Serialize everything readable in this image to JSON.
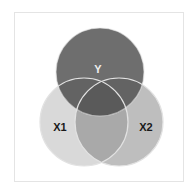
{
  "diagram": {
    "type": "venn",
    "sets": [
      {
        "id": "Y",
        "label": "Y",
        "color": "#6e6e6e",
        "label_color": "#eeeeee"
      },
      {
        "id": "X1",
        "label": "X1",
        "color": "#d9d9d9",
        "label_color": "#1a1a1a"
      },
      {
        "id": "X2",
        "label": "X2",
        "color": "#bebebe",
        "label_color": "#1a1a1a"
      }
    ],
    "overlap_colors": {
      "Y_X1": "#5f5f5f",
      "Y_X2": "#5f5f5f",
      "X1_X2": "#a9a9a9",
      "Y_X1_X2": "#5a5a5a"
    },
    "stroke_color": "#e2e2e2",
    "frame_border_color": "#e4e4e4"
  }
}
